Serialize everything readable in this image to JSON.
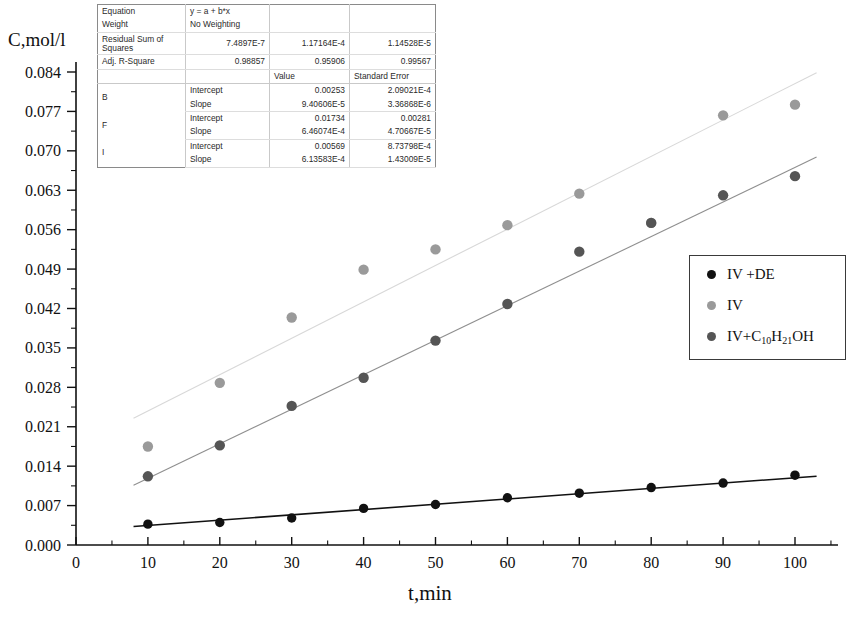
{
  "chart_data": {
    "type": "scatter",
    "title": "",
    "xlabel": "t,min",
    "ylabel": "C,mol/l",
    "xlim": [
      0,
      105
    ],
    "ylim": [
      0.0,
      0.0875
    ],
    "xticks": [
      0,
      10,
      20,
      30,
      40,
      50,
      60,
      70,
      80,
      90,
      100
    ],
    "yticks": [
      "0.000",
      "0.007",
      "0.014",
      "0.021",
      "0.028",
      "0.035",
      "0.042",
      "0.049",
      "0.056",
      "0.063",
      "0.070",
      "0.077",
      "0.084"
    ],
    "ytick_values": [
      0.0,
      0.007,
      0.014,
      0.021,
      0.028,
      0.035,
      0.042,
      0.049,
      0.056,
      0.063,
      0.07,
      0.077,
      0.084
    ],
    "minor_ticks": true,
    "grid": false,
    "legend_position": "right",
    "x": [
      10,
      20,
      30,
      40,
      50,
      60,
      70,
      80,
      90,
      100
    ],
    "series": [
      {
        "name": "IV +DE",
        "color": "#111111",
        "marker": "circle",
        "marker_size": 7,
        "fit_line": true,
        "fit_intercept": 0.00253,
        "fit_slope": 9.40606e-05,
        "values": [
          0.0037,
          0.004,
          0.0048,
          0.0065,
          0.0072,
          0.0084,
          0.0092,
          0.0102,
          0.011,
          0.0124
        ]
      },
      {
        "name": "IV",
        "color": "#9a9a9a",
        "marker": "circle",
        "marker_size": 8,
        "fit_line": true,
        "fit_intercept": 0.01734,
        "fit_slope": 0.000646074,
        "values": [
          0.0175,
          0.0288,
          0.0404,
          0.0489,
          0.0525,
          0.0568,
          0.0624,
          0.0572,
          0.0763,
          0.0782
        ]
      },
      {
        "name": "IV+C10H21OH",
        "name_html": "IV+C<sub>10</sub>H<sub>21</sub>OH",
        "color": "#555555",
        "marker": "circle",
        "marker_size": 8,
        "fit_line": true,
        "fit_intercept": 0.00569,
        "fit_slope": 0.000613583,
        "values": [
          0.0122,
          0.0177,
          0.0247,
          0.0297,
          0.0363,
          0.0428,
          0.0521,
          0.0572,
          0.0621,
          0.0655
        ]
      }
    ]
  },
  "fit_table": {
    "rows": [
      {
        "label": "Equation",
        "c1": "y = a + b*x",
        "c2": "",
        "c3": ""
      },
      {
        "label": "Weight",
        "c1": "No Weighting",
        "c2": "",
        "c3": ""
      },
      {
        "label": "Residual Sum of Squares",
        "c1": "7.4897E-7",
        "c2": "1.17164E-4",
        "c3": "1.14528E-5"
      },
      {
        "label": "Adj. R-Square",
        "c1": "0.98857",
        "c2": "0.95906",
        "c3": "0.99567"
      },
      {
        "label": "",
        "c1": "",
        "c2": "Value",
        "c3": "Standard Error"
      }
    ],
    "param_groups": [
      {
        "group": "B",
        "rows": [
          {
            "param": "Intercept",
            "value": "0.00253",
            "stderr": "2.09021E-4"
          },
          {
            "param": "Slope",
            "value": "9.40606E-5",
            "stderr": "3.36868E-6"
          }
        ]
      },
      {
        "group": "F",
        "rows": [
          {
            "param": "Intercept",
            "value": "0.01734",
            "stderr": "0.00281"
          },
          {
            "param": "Slope",
            "value": "6.46074E-4",
            "stderr": "4.70667E-5"
          }
        ]
      },
      {
        "group": "I",
        "rows": [
          {
            "param": "Intercept",
            "value": "0.00569",
            "stderr": "8.73798E-4"
          },
          {
            "param": "Slope",
            "value": "6.13583E-4",
            "stderr": "1.43009E-5"
          }
        ]
      }
    ]
  },
  "legend": {
    "items": [
      {
        "label": "IV +DE",
        "label_html": "IV +DE",
        "color": "#111111"
      },
      {
        "label": "IV",
        "label_html": "IV",
        "color": "#9a9a9a"
      },
      {
        "label": "IV+C10H21OH",
        "label_html": "IV+C<sub>10</sub>H<sub>21</sub>OH",
        "color": "#555555"
      }
    ]
  }
}
